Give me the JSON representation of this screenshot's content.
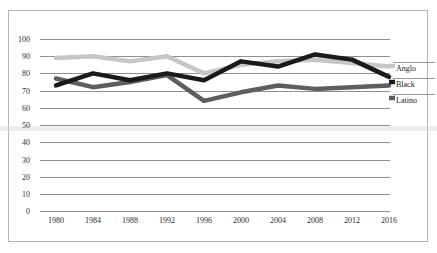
{
  "chart_data": {
    "type": "line",
    "title": "",
    "xlabel": "",
    "ylabel": "",
    "categories": [
      "1980",
      "1984",
      "1988",
      "1992",
      "1996",
      "2000",
      "2004",
      "2008",
      "2012",
      "2016"
    ],
    "x": [
      1980,
      1984,
      1988,
      1992,
      1996,
      2000,
      2004,
      2008,
      2012,
      2016
    ],
    "ylim": [
      0,
      100
    ],
    "xlim": [
      1980,
      2016
    ],
    "grid": true,
    "legend_position": "right",
    "ytick_labels": [
      "100",
      "90",
      "80",
      "70",
      "60",
      "50",
      "40",
      "30",
      "20",
      "10",
      "0"
    ],
    "ytick_values": [
      100,
      90,
      80,
      70,
      60,
      50,
      40,
      30,
      20,
      10,
      0
    ],
    "series": [
      {
        "name": "Anglo",
        "color": "#c6c6c6",
        "values": [
          89,
          90,
          87,
          90,
          80,
          85,
          87,
          88,
          86,
          84
        ]
      },
      {
        "name": "Black",
        "color": "#1a1a1a",
        "values": [
          73,
          80,
          76,
          80,
          76,
          87,
          84,
          91,
          88,
          78
        ]
      },
      {
        "name": "Latino",
        "color": "#5e5e5e",
        "values": [
          77,
          72,
          75,
          79,
          64,
          69,
          73,
          71,
          72,
          73
        ]
      }
    ]
  },
  "legend": {
    "entries": [
      {
        "label": "Anglo",
        "color": "#c6c6c6"
      },
      {
        "label": "Black",
        "color": "#1a1a1a"
      },
      {
        "label": "Latino",
        "color": "#5e5e5e"
      }
    ]
  },
  "style": {
    "grid_color": "#8f8f8f",
    "frame_color": "#b4b4b4",
    "background": "#ffffff",
    "tick_text_color": "#2b2b2b"
  }
}
